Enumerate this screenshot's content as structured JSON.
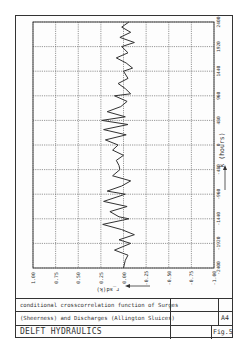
{
  "chart_data": {
    "type": "line",
    "orientation": "rotated-90",
    "title": "conditional crosscorrelation function of Surges (Sheerness) and Discharges (Allington Sluices)",
    "xlabel": "k (hours)",
    "ylabel": "r_sd(k)",
    "x_ticks": [
      2400,
      1920,
      1440,
      960,
      480,
      0,
      -480,
      -960,
      -1440,
      -1920,
      -2400
    ],
    "y_ticks": [
      "1.00",
      "0.75",
      "0.50",
      "0.25",
      "0.00",
      "-0.25",
      "-0.50",
      "-0.75",
      "-1.00"
    ],
    "xlim": [
      -2400,
      2400
    ],
    "ylim": [
      -1.0,
      1.0
    ],
    "grid": true,
    "legend": null,
    "series": [
      {
        "name": "r_sd(k)",
        "x": [
          2400,
          2300,
          2200,
          2100,
          2000,
          1920,
          1800,
          1700,
          1600,
          1500,
          1440,
          1300,
          1200,
          1100,
          1000,
          960,
          850,
          750,
          650,
          550,
          480,
          400,
          300,
          200,
          100,
          0,
          -100,
          -200,
          -300,
          -400,
          -480,
          -600,
          -700,
          -800,
          -900,
          -960,
          -1100,
          -1200,
          -1300,
          -1400,
          -1440,
          -1550,
          -1650,
          -1750,
          -1850,
          -1920,
          -2050,
          -2150,
          -2250,
          -2400
        ],
        "values": [
          -0.06,
          0.02,
          -0.08,
          0.04,
          -0.12,
          0.02,
          -0.05,
          0.08,
          -0.03,
          -0.1,
          0.0,
          -0.05,
          0.06,
          -0.02,
          -0.08,
          0.1,
          -0.04,
          0.03,
          0.18,
          -0.02,
          0.24,
          -0.05,
          0.22,
          -0.03,
          0.2,
          0.06,
          0.12,
          0.0,
          0.08,
          0.05,
          0.04,
          0.12,
          -0.08,
          0.02,
          0.18,
          -0.02,
          0.22,
          -0.04,
          0.15,
          0.05,
          -0.06,
          0.23,
          0.02,
          -0.12,
          0.05,
          -0.08,
          0.1,
          -0.05,
          -0.02,
          0.0
        ]
      }
    ]
  },
  "title_block": {
    "line1": "conditional crosscorrelation function of Surges",
    "line2": "(Sheerness) and Discharges (Allington Sluices)",
    "organisation": "DELFT HYDRAULICS",
    "sheet_size": "A4",
    "figure": "Fig.5"
  },
  "colors": {
    "line": "#333333",
    "grid": "#555555",
    "frame": "#333333"
  }
}
